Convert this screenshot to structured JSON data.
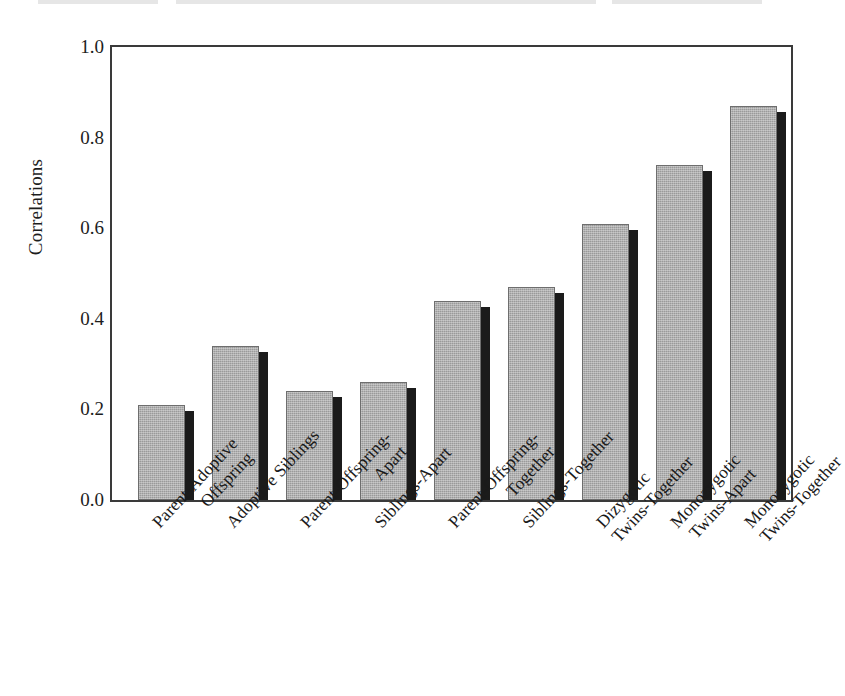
{
  "chart_data": {
    "type": "bar",
    "title": "",
    "subtitle": "",
    "xlabel": "",
    "ylabel": "Correlations",
    "ylim": [
      0.0,
      1.0
    ],
    "yticks": [
      "0.0",
      "0.2",
      "0.4",
      "0.6",
      "0.8",
      "1.0"
    ],
    "ytick_values": [
      0.0,
      0.2,
      0.4,
      0.6,
      0.8,
      1.0
    ],
    "grid": false,
    "legend": "none",
    "series_name": "Correlations",
    "bar_fill_color": "#9a9a9a",
    "bar_shadow_color": "#1b1b1b",
    "bar_edge_color": "#6e6e6e",
    "axis_color": "#3a3a3a",
    "background_color": "#ffffff",
    "categories": [
      "Parent-Adoptive Offspring",
      "Adoptive Siblings",
      "Parent-Offspring-Apart",
      "Siblings-Apart",
      "Parent-Offspring-Together",
      "Siblings-Together",
      "Dizygotic Twins-Together",
      "Monozygotic Twins-Apart",
      "Monozygotic Twins-Together"
    ],
    "values": [
      0.21,
      0.34,
      0.24,
      0.26,
      0.44,
      0.47,
      0.61,
      0.74,
      0.87
    ],
    "bars": [
      {
        "label_line1": "Parent-Adoptive",
        "label_line2": "Offspring",
        "value": 0.21
      },
      {
        "label_line1": "Adoptive Siblings",
        "label_line2": "",
        "value": 0.34
      },
      {
        "label_line1": "Parent-Offspring-",
        "label_line2": "Apart",
        "value": 0.24
      },
      {
        "label_line1": "Siblings-Apart",
        "label_line2": "",
        "value": 0.26
      },
      {
        "label_line1": "Parent-Offspring-",
        "label_line2": "Together",
        "value": 0.44
      },
      {
        "label_line1": "Siblings-Together",
        "label_line2": "",
        "value": 0.47
      },
      {
        "label_line1": "Dizygotic",
        "label_line2": "Twins-Together",
        "value": 0.61
      },
      {
        "label_line1": "Monozygotic",
        "label_line2": "Twins-Apart",
        "value": 0.74
      },
      {
        "label_line1": "Monozygotic",
        "label_line2": "Twins-Together",
        "value": 0.87
      }
    ]
  }
}
